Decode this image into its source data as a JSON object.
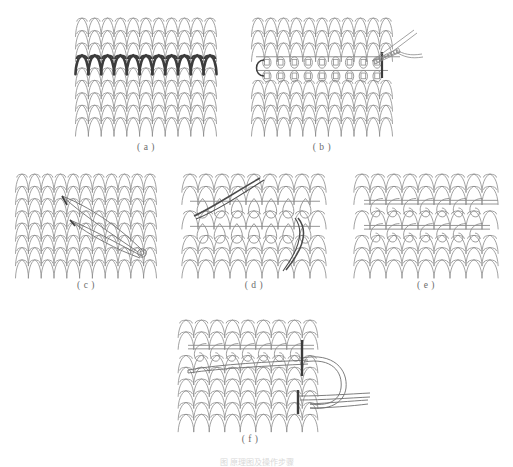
{
  "figure": {
    "caption": "图  原理图及操作步骤",
    "caption_y": 456,
    "background": "#ffffff",
    "line_color": "#8a8a8a",
    "dark_line_color": "#3c3c3c",
    "label_color": "#6b6b6b"
  },
  "panels": [
    {
      "id": "a",
      "label": "( a )",
      "title": "knitted-fabric-with-damaged-course",
      "x": 78,
      "y": 16,
      "width": 136,
      "height": 122,
      "label_y": 144,
      "columns": 10,
      "rows": 10,
      "highlight_row": 3,
      "highlight_style": "hatched-dark",
      "description": "plain jersey fabric with one highlighted damaged course"
    },
    {
      "id": "b",
      "label": "( b )",
      "title": "loops-picked-up-on-transfer-yarn",
      "x": 254,
      "y": 16,
      "width": 136,
      "height": 122,
      "label_y": 144,
      "columns": 10,
      "rows": 10,
      "open_rows": [
        3,
        4
      ],
      "tool": "threaded-needle",
      "tool_x": 392,
      "tool_y": 22,
      "description": "two courses opened and threaded onto holding yarns with needle at right"
    },
    {
      "id": "c",
      "label": "( c )",
      "title": "darning-needle-inserted-through-fabric",
      "x": 18,
      "y": 172,
      "width": 136,
      "height": 104,
      "label_y": 282,
      "columns": 10,
      "rows": 9,
      "tool": "darning-needle",
      "needle_tip_x": 62,
      "needle_tip_y": 196,
      "needle_eye_x": 142,
      "needle_eye_y": 250,
      "description": "blunt darning needle passed diagonally through the fabric, eye at lower right"
    },
    {
      "id": "d",
      "label": "( d )",
      "title": "open-loops-released-two-courses",
      "x": 186,
      "y": 172,
      "width": 136,
      "height": 104,
      "label_y": 282,
      "columns": 8,
      "rows": 9,
      "open_rows": [
        2,
        4
      ],
      "loop_shape": "teardrop",
      "threads": 2,
      "description": "two courses of released teardrop loops with dark yarn ends entering and leaving"
    },
    {
      "id": "e",
      "label": "( e )",
      "title": "loops-held-on-two-guide-yarns",
      "x": 358,
      "y": 172,
      "width": 136,
      "height": 104,
      "label_y": 282,
      "columns": 8,
      "rows": 9,
      "open_rows": [
        2,
        4
      ],
      "loop_shape": "hook",
      "description": "upper and lower sets of open loops held on straight guide yarns"
    },
    {
      "id": "f",
      "label": "( f )",
      "title": "grafting-yarn-drawn-through-loops",
      "x": 182,
      "y": 318,
      "width": 136,
      "height": 112,
      "label_y": 436,
      "columns": 8,
      "rows": 10,
      "open_rows": [
        2
      ],
      "tool": "needle-with-drawn-loop",
      "description": "grafting yarn pulled through the held loops forming a large working loop at the right"
    }
  ]
}
